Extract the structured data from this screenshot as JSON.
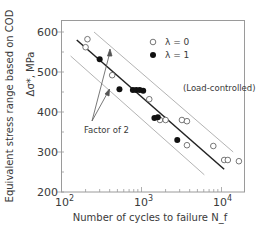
{
  "chart_data": {
    "type": "scatter",
    "title": "",
    "xlabel": "Number of cycles to failure N_f",
    "ylabel_line1": "Equivalent stress range based on COD",
    "ylabel_line2": "Δσ*, MPa",
    "xscale": "log",
    "xlim": [
      100,
      18000
    ],
    "ylim": [
      200,
      640
    ],
    "x_ticks": [
      {
        "value": 100,
        "label": "10",
        "exp": "2"
      },
      {
        "value": 1000,
        "label": "10",
        "exp": "3"
      },
      {
        "value": 10000,
        "label": "10",
        "exp": "4"
      }
    ],
    "y_ticks": [
      200,
      300,
      400,
      500,
      600
    ],
    "grid": false,
    "legend_position": "upper right",
    "series": [
      {
        "name": "λ = 0",
        "marker": "open-circle",
        "points": [
          {
            "x": 211,
            "y": 582
          },
          {
            "x": 200,
            "y": 562
          },
          {
            "x": 430,
            "y": 492
          },
          {
            "x": 1250,
            "y": 432
          },
          {
            "x": 1700,
            "y": 380
          },
          {
            "x": 2000,
            "y": 380
          },
          {
            "x": 3200,
            "y": 380
          },
          {
            "x": 3700,
            "y": 377
          },
          {
            "x": 3700,
            "y": 317
          },
          {
            "x": 7900,
            "y": 315
          },
          {
            "x": 10800,
            "y": 280
          },
          {
            "x": 12000,
            "y": 280
          },
          {
            "x": 16500,
            "y": 277
          }
        ]
      },
      {
        "name": "λ = 1",
        "marker": "filled-circle",
        "points": [
          {
            "x": 300,
            "y": 532
          },
          {
            "x": 530,
            "y": 457
          },
          {
            "x": 780,
            "y": 455
          },
          {
            "x": 860,
            "y": 455
          },
          {
            "x": 950,
            "y": 455
          },
          {
            "x": 1050,
            "y": 453
          },
          {
            "x": 1450,
            "y": 385
          },
          {
            "x": 1600,
            "y": 387
          },
          {
            "x": 2800,
            "y": 330
          }
        ]
      }
    ],
    "lines": [
      {
        "name": "mean-fit",
        "style": "solid-bold",
        "from": {
          "x": 155,
          "y": 580
        },
        "to": {
          "x": 10800,
          "y": 257
        }
      },
      {
        "name": "upper-factor-of-2",
        "style": "solid-thin",
        "from": {
          "x": 255,
          "y": 600
        },
        "to": {
          "x": 14000,
          "y": 300
        }
      },
      {
        "name": "lower-factor-of-2",
        "style": "solid-thin",
        "from": {
          "x": 130,
          "y": 540
        },
        "to": {
          "x": 6100,
          "y": 243
        }
      }
    ],
    "annotations": [
      {
        "text": "Factor of 2",
        "arrows_to": [
          "upper-factor-of-2",
          "lower-factor-of-2"
        ]
      },
      {
        "text": "(Load-controlled)"
      }
    ]
  }
}
